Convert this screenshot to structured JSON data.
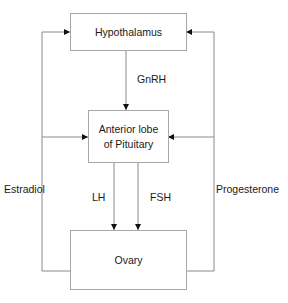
{
  "diagram": {
    "nodes": {
      "hypothalamus": "Hypothalamus",
      "pituitary_line1": "Anterior lobe",
      "pituitary_line2": "of Pituitary",
      "ovary": "Ovary"
    },
    "edges": {
      "gnrh": "GnRH",
      "lh": "LH",
      "fsh": "FSH",
      "estradiol": "Estradiol",
      "progesterone": "Progesterone"
    },
    "colors": {
      "line": "#8a8a8a",
      "box_border": "#a8a8a8",
      "arrow": "#111111"
    }
  }
}
